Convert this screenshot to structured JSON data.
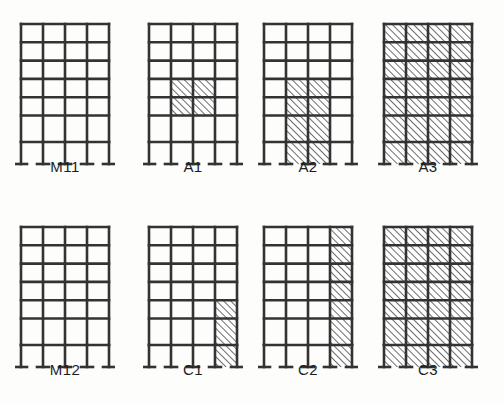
{
  "figure": {
    "type": "engineering-diagram",
    "background_color": "#fdfdfb",
    "line_color": "#333333",
    "hatch_color": "#3a3a3a",
    "label_color": "#1d1d1d",
    "frame_geometry": {
      "bays": 4,
      "stories": 6,
      "base_support": "T-shaped base plate on each column",
      "ground_story_taller": true,
      "hatch_angle_degrees": 45,
      "hatch_direction": "bottom-left to top-right"
    },
    "rows": [
      {
        "row_index": 0,
        "frames": [
          {
            "label": "M11",
            "description": "Bare moment frame, no infill",
            "infill_cells": []
          },
          {
            "label": "A1",
            "description": "Central infill block, two bays wide by two stories",
            "infill_cells": [
              {
                "story": 3,
                "bay": 1
              },
              {
                "story": 3,
                "bay": 2
              },
              {
                "story": 4,
                "bay": 1
              },
              {
                "story": 4,
                "bay": 2
              }
            ],
            "below_grade_infill_bays": []
          },
          {
            "label": "A2",
            "description": "Central infill block extended to ground, two bays wide by three stories",
            "infill_cells": [
              {
                "story": 3,
                "bay": 1
              },
              {
                "story": 3,
                "bay": 2
              },
              {
                "story": 4,
                "bay": 1
              },
              {
                "story": 4,
                "bay": 2
              },
              {
                "story": 5,
                "bay": 1
              },
              {
                "story": 5,
                "bay": 2
              }
            ],
            "below_grade_infill_bays": [
              1,
              2
            ]
          },
          {
            "label": "A3",
            "description": "Fully infilled frame, all bays and all stories",
            "infill_cells": [
              {
                "story": 0,
                "bay": 0
              },
              {
                "story": 0,
                "bay": 1
              },
              {
                "story": 0,
                "bay": 2
              },
              {
                "story": 0,
                "bay": 3
              },
              {
                "story": 1,
                "bay": 0
              },
              {
                "story": 1,
                "bay": 1
              },
              {
                "story": 1,
                "bay": 2
              },
              {
                "story": 1,
                "bay": 3
              },
              {
                "story": 2,
                "bay": 0
              },
              {
                "story": 2,
                "bay": 1
              },
              {
                "story": 2,
                "bay": 2
              },
              {
                "story": 2,
                "bay": 3
              },
              {
                "story": 3,
                "bay": 0
              },
              {
                "story": 3,
                "bay": 1
              },
              {
                "story": 3,
                "bay": 2
              },
              {
                "story": 3,
                "bay": 3
              },
              {
                "story": 4,
                "bay": 0
              },
              {
                "story": 4,
                "bay": 1
              },
              {
                "story": 4,
                "bay": 2
              },
              {
                "story": 4,
                "bay": 3
              },
              {
                "story": 5,
                "bay": 0
              },
              {
                "story": 5,
                "bay": 1
              },
              {
                "story": 5,
                "bay": 2
              },
              {
                "story": 5,
                "bay": 3
              }
            ],
            "below_grade_infill_bays": [
              0,
              1,
              2,
              3
            ]
          }
        ]
      },
      {
        "row_index": 1,
        "frames": [
          {
            "label": "M12",
            "description": "Bare moment frame, no infill",
            "infill_cells": []
          },
          {
            "label": "C1",
            "description": "Right edge bay infilled at the lowest two stories",
            "infill_cells": [
              {
                "story": 4,
                "bay": 3
              },
              {
                "story": 5,
                "bay": 3
              }
            ],
            "below_grade_infill_bays": [
              3
            ]
          },
          {
            "label": "C2",
            "description": "Right edge bay infilled over full height",
            "infill_cells": [
              {
                "story": 0,
                "bay": 3
              },
              {
                "story": 1,
                "bay": 3
              },
              {
                "story": 2,
                "bay": 3
              },
              {
                "story": 3,
                "bay": 3
              },
              {
                "story": 4,
                "bay": 3
              },
              {
                "story": 5,
                "bay": 3
              }
            ],
            "below_grade_infill_bays": [
              3
            ]
          },
          {
            "label": "C3",
            "description": "Fully infilled frame, all bays and all stories",
            "infill_cells": [
              {
                "story": 0,
                "bay": 0
              },
              {
                "story": 0,
                "bay": 1
              },
              {
                "story": 0,
                "bay": 2
              },
              {
                "story": 0,
                "bay": 3
              },
              {
                "story": 1,
                "bay": 0
              },
              {
                "story": 1,
                "bay": 1
              },
              {
                "story": 1,
                "bay": 2
              },
              {
                "story": 1,
                "bay": 3
              },
              {
                "story": 2,
                "bay": 0
              },
              {
                "story": 2,
                "bay": 1
              },
              {
                "story": 2,
                "bay": 2
              },
              {
                "story": 2,
                "bay": 3
              },
              {
                "story": 3,
                "bay": 0
              },
              {
                "story": 3,
                "bay": 1
              },
              {
                "story": 3,
                "bay": 2
              },
              {
                "story": 3,
                "bay": 3
              },
              {
                "story": 4,
                "bay": 0
              },
              {
                "story": 4,
                "bay": 1
              },
              {
                "story": 4,
                "bay": 2
              },
              {
                "story": 4,
                "bay": 3
              },
              {
                "story": 5,
                "bay": 0
              },
              {
                "story": 5,
                "bay": 1
              },
              {
                "story": 5,
                "bay": 2
              },
              {
                "story": 5,
                "bay": 3
              }
            ],
            "below_grade_infill_bays": [
              0,
              1,
              2,
              3
            ]
          }
        ]
      }
    ]
  }
}
